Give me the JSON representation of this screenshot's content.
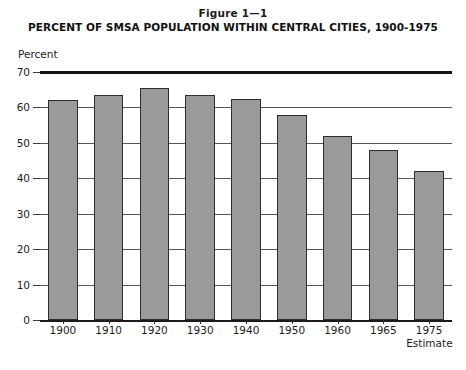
{
  "figure": {
    "number": "Figure 1—1",
    "title": "PERCENT OF SMSA POPULATION WITHIN CENTRAL CITIES, 1900-1975",
    "unit_caption": "Percent"
  },
  "axis": {
    "y_ticks": [
      "0",
      "10",
      "20",
      "30",
      "40",
      "50",
      "60",
      "70"
    ],
    "x_estimate_note": "Estimate"
  },
  "colors": {
    "bar_fill": "#9a9a9a",
    "bar_border": "#2e2e2e",
    "gridline": "#55555a",
    "top_rule": "#151515",
    "text": "#1b1b1b",
    "background": "#ffffff"
  },
  "chart_data": {
    "type": "bar",
    "title": "PERCENT OF SMSA POPULATION WITHIN CENTRAL CITIES, 1900-1975",
    "subtitle": "Figure 1—1",
    "xlabel": "",
    "ylabel": "Percent",
    "categories": [
      "1900",
      "1910",
      "1920",
      "1930",
      "1940",
      "1950",
      "1960",
      "1965",
      "1975"
    ],
    "values": [
      62,
      63.5,
      65.5,
      63.5,
      62.5,
      58,
      52,
      48,
      42
    ],
    "ylim": [
      0,
      70
    ],
    "yticks": [
      0,
      10,
      20,
      30,
      40,
      50,
      60,
      70
    ],
    "grid": true,
    "legend": false,
    "annotations": [
      {
        "category": "1975",
        "text": "Estimate"
      }
    ]
  }
}
